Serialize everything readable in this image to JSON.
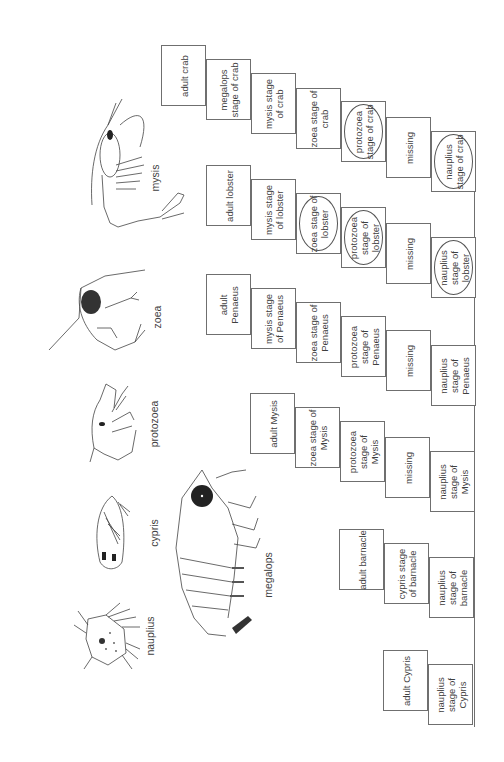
{
  "diagram": {
    "title": "",
    "orientation": "rotated-90-ccw",
    "larval_stage_illustrations": [
      {
        "id": "mysis",
        "label": "mysis"
      },
      {
        "id": "zoea",
        "label": "zoea"
      },
      {
        "id": "protozoea",
        "label": "protozoea"
      },
      {
        "id": "cypris",
        "label": "cypris"
      },
      {
        "id": "nauplius",
        "label": "nauplius"
      },
      {
        "id": "megalops",
        "label": "megalops"
      }
    ],
    "life_cycles": [
      {
        "organism": "crab",
        "stages": [
          {
            "text": "adult crab",
            "circled": false
          },
          {
            "text": "megalops stage of crab",
            "circled": false
          },
          {
            "text": "mysis stage of crab",
            "circled": false
          },
          {
            "text": "zoea stage of crab",
            "circled": false
          },
          {
            "text": "protozoea stage of crab",
            "circled": true
          },
          {
            "text": "missing",
            "circled": false
          },
          {
            "text": "nauplius stage of crab",
            "circled": true
          }
        ]
      },
      {
        "organism": "lobster",
        "stages": [
          {
            "text": "adult lobster",
            "circled": false
          },
          {
            "text": "mysis stage of lobster",
            "circled": false
          },
          {
            "text": "zoea stage of lobster",
            "circled": true
          },
          {
            "text": "protozoea stage of lobster",
            "circled": true
          },
          {
            "text": "missing",
            "circled": false
          },
          {
            "text": "nauplius stage of lobster",
            "circled": true
          }
        ]
      },
      {
        "organism": "Penaeus",
        "stages": [
          {
            "text": "adult Penaeus",
            "circled": false
          },
          {
            "text": "mysis stage of Penaeus",
            "circled": false
          },
          {
            "text": "zoea stage of Penaeus",
            "circled": false
          },
          {
            "text": "protozoea stage of Penaeus",
            "circled": false
          },
          {
            "text": "missing",
            "circled": false
          },
          {
            "text": "nauplius stage of Penaeus",
            "circled": false
          }
        ]
      },
      {
        "organism": "Mysis",
        "stages": [
          {
            "text": "adult Mysis",
            "circled": false
          },
          {
            "text": "zoea stage of Mysis",
            "circled": false
          },
          {
            "text": "protozoea stage of Mysis",
            "circled": false
          },
          {
            "text": "missing",
            "circled": false
          },
          {
            "text": "nauplius stage of Mysis",
            "circled": false
          }
        ]
      },
      {
        "organism": "barnacle",
        "stages": [
          {
            "text": "adult barnacle",
            "circled": false
          },
          {
            "text": "cypris stage of barnacle",
            "circled": false
          },
          {
            "text": "nauplius stage of barnacle",
            "circled": false
          }
        ]
      },
      {
        "organism": "Cypris",
        "stages": [
          {
            "text": "adult Cypris",
            "circled": false
          },
          {
            "text": "nauplius stage of Cypris",
            "circled": false
          }
        ]
      }
    ]
  }
}
